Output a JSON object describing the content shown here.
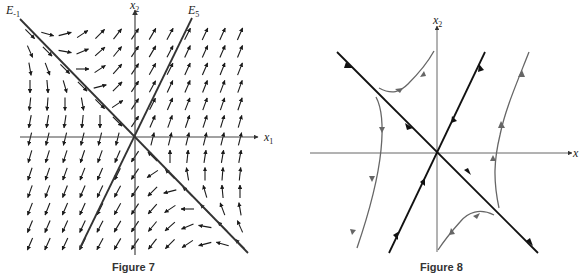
{
  "figure7": {
    "caption": "Figure 7",
    "axes": {
      "x_label": "x",
      "x_sub": "1",
      "y_label": "x",
      "y_sub": "2"
    },
    "eigenlines": [
      {
        "label": "E",
        "sub": "-1",
        "direction": "y = -x"
      },
      {
        "label": "E",
        "sub": "5",
        "direction": "y = 2x"
      }
    ],
    "type": "direction field",
    "colors": {
      "ink": "#222222",
      "arrows": "#1a1a1a"
    }
  },
  "figure8": {
    "caption": "Figure 8",
    "axes": {
      "x_label": "x",
      "y_label": "x",
      "y_sub": "2"
    },
    "type": "phase portrait (saddle)",
    "colors": {
      "ink": "#111111",
      "trajectories": "#666666"
    }
  }
}
